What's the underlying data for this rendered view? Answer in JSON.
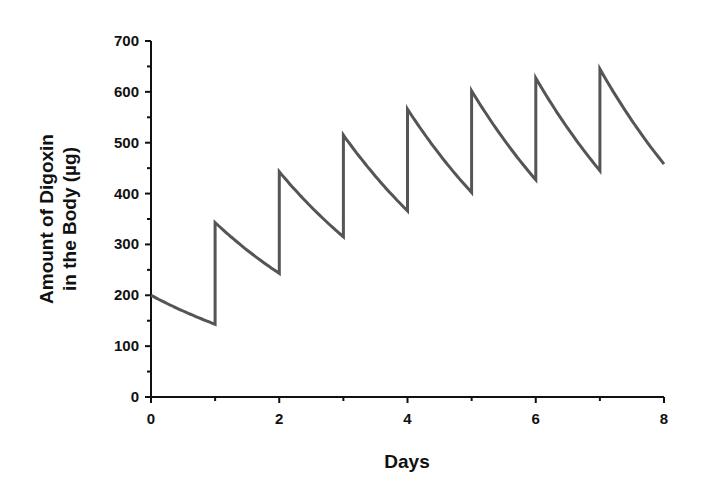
{
  "chart_data": {
    "type": "line",
    "title": "",
    "xlabel": "Days",
    "ylabel_lines": [
      "Amount of Digoxin",
      "in the Body (µg)"
    ],
    "ylabel": "Amount of Digoxin in the Body (µg)",
    "xlim": [
      0,
      8
    ],
    "ylim": [
      0,
      700
    ],
    "x_ticks": [
      0,
      2,
      4,
      6,
      8
    ],
    "x_minor_ticks": [
      1,
      3,
      5,
      7
    ],
    "y_ticks": [
      0,
      100,
      200,
      300,
      400,
      500,
      600,
      700
    ],
    "y_minor_ticks": [
      50,
      150,
      250,
      350,
      450,
      550,
      650
    ],
    "grid": false,
    "legend": null,
    "dose_ug": 200,
    "daily_fraction_remaining": 0.715,
    "series": [
      {
        "name": "Digoxin amount",
        "color": "#555555",
        "troughs": [
          {
            "x": 1,
            "y": 143
          },
          {
            "x": 2,
            "y": 243
          },
          {
            "x": 3,
            "y": 315
          },
          {
            "x": 4,
            "y": 366
          },
          {
            "x": 5,
            "y": 402
          },
          {
            "x": 6,
            "y": 427
          },
          {
            "x": 7,
            "y": 445
          }
        ],
        "peaks": [
          {
            "x": 0,
            "y": 200
          },
          {
            "x": 1,
            "y": 343
          },
          {
            "x": 2,
            "y": 443
          },
          {
            "x": 3,
            "y": 515
          },
          {
            "x": 4,
            "y": 566
          },
          {
            "x": 5,
            "y": 602
          },
          {
            "x": 6,
            "y": 627
          },
          {
            "x": 7,
            "y": 645
          }
        ],
        "end": {
          "x": 8,
          "y": 458
        }
      }
    ]
  },
  "plot_area": {
    "x0_px": 151,
    "x1_px": 664,
    "y0_px": 397,
    "y1_px": 41
  }
}
